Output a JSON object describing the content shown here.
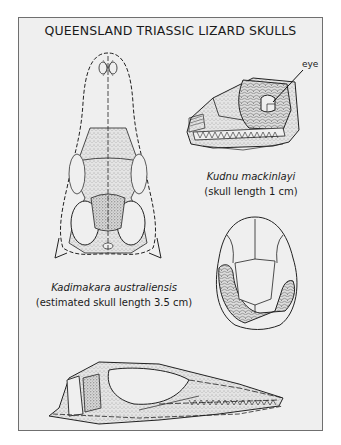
{
  "figure": {
    "title": "QUEENSLAND TRIASSIC LIZARD SKULLS",
    "specimens": [
      {
        "id": "kadimakara",
        "species": "Kadimakara australiensis",
        "size_note": "(estimated skull length 3.5 cm)",
        "views": [
          "dorsal view",
          "lateral view"
        ]
      },
      {
        "id": "kudnu",
        "species": "Kudnu mackinlayi",
        "size_note": "(skull length 1 cm)",
        "views": [
          "lateral view",
          "dorsal view"
        ]
      }
    ],
    "annotations": [
      {
        "label": "eye",
        "points_to": "kudnu lateral orbit"
      }
    ],
    "colors": {
      "panel_background": "#efefef",
      "frame_border": "#6f6f6f",
      "ink": "#1a1a1a"
    }
  }
}
